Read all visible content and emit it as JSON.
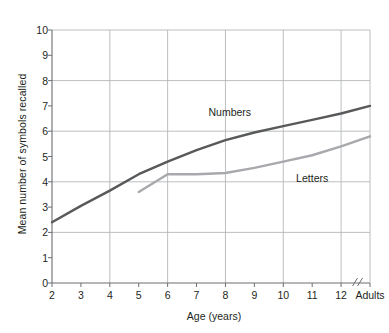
{
  "chart_data": {
    "type": "line",
    "title": "",
    "xlabel": "Age (years)",
    "ylabel": "Mean number of symbols recalled",
    "xlim": [
      2,
      13
    ],
    "ylim": [
      0,
      10
    ],
    "grid": true,
    "grid_x_values": [
      4,
      6,
      8,
      10,
      12
    ],
    "grid_y_values": [
      2,
      4,
      6,
      8,
      10
    ],
    "axis_break": "//",
    "axis_break_note": "x-axis break between age 12 and Adults",
    "legend_position": "inline-labels",
    "x_tick_labels": [
      "2",
      "3",
      "4",
      "5",
      "6",
      "7",
      "8",
      "9",
      "10",
      "11",
      "12",
      "Adults"
    ],
    "y_tick_labels": [
      "0",
      "1",
      "2",
      "3",
      "4",
      "5",
      "6",
      "7",
      "8",
      "9",
      "10"
    ],
    "series": [
      {
        "name": "Numbers",
        "color": "#58595b",
        "x": [
          2,
          3,
          4,
          5,
          6,
          7,
          8,
          9,
          10,
          11,
          12,
          13
        ],
        "x_labels": [
          "2",
          "3",
          "4",
          "5",
          "6",
          "7",
          "8",
          "9",
          "10",
          "11",
          "12",
          "Adults"
        ],
        "values": [
          2.4,
          3.05,
          3.65,
          4.3,
          4.8,
          5.25,
          5.65,
          5.95,
          6.2,
          6.45,
          6.7,
          7.0
        ]
      },
      {
        "name": "Letters",
        "color": "#a7a9ac",
        "x": [
          5,
          6,
          7,
          8,
          9,
          10,
          11,
          12,
          13
        ],
        "x_labels": [
          "5",
          "6",
          "7",
          "8",
          "9",
          "10",
          "11",
          "12",
          "Adults"
        ],
        "values": [
          3.6,
          4.3,
          4.3,
          4.35,
          4.55,
          4.8,
          5.05,
          5.4,
          5.8
        ]
      }
    ]
  },
  "axes": {
    "y_title": "Mean number of symbols recalled",
    "x_title": "Age (years)"
  },
  "annotations": {
    "numbers_label": "Numbers",
    "letters_label": "Letters",
    "break_mark": "//"
  }
}
